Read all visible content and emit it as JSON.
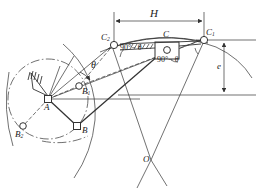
{
  "figure": {
    "type": "mechanism-kinematic-diagram",
    "stroke_color": "#333333",
    "background": "#ffffff"
  },
  "labels": {
    "stroke_dim": "H",
    "offset_dim": "e",
    "angle_theta": "θ",
    "angle_complement_left": "90°− θ",
    "angle_complement_right": "90°− θ",
    "pivot_a": "A",
    "crank_b": "B",
    "crank_b1": "B",
    "crank_b1_sub": "1",
    "crank_b2": "B",
    "crank_b2_sub": "2",
    "coupler_c": "C",
    "coupler_c1": "C",
    "coupler_c1_sub": "1",
    "coupler_c2": "C",
    "coupler_c2_sub": "2",
    "center_o": "O"
  },
  "geometry": {
    "pivot_a": [
      48,
      99
    ],
    "point_b": [
      77,
      126
    ],
    "point_b1": [
      79,
      86
    ],
    "point_b2": [
      23,
      126
    ],
    "point_c": [
      166,
      49
    ],
    "point_c1": [
      204,
      39
    ],
    "point_c2": [
      114,
      44
    ],
    "point_o": [
      151,
      160
    ],
    "crank_circle_center": [
      48,
      99
    ],
    "crank_circle_radius": 40,
    "stroke_dim_y": 17,
    "offset_top_y": 40,
    "offset_bottom_y": 95
  }
}
